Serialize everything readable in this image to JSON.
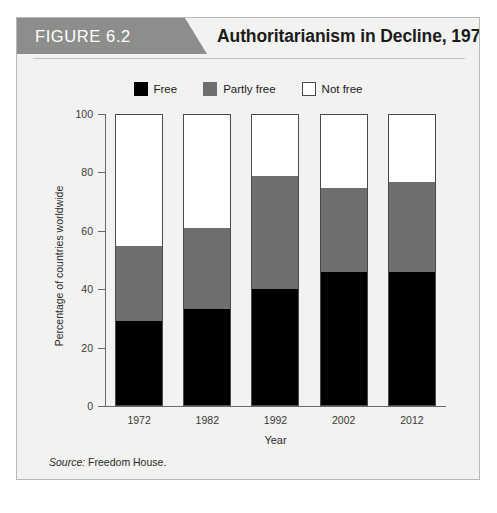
{
  "figure": {
    "tag": "FIGURE 6.2",
    "title": "Authoritarianism in Decline, 1972–2012",
    "source_label": "Source:",
    "source_text": "Freedom House."
  },
  "colors": {
    "free": "#000000",
    "partly_free": "#6e6e6c",
    "not_free": "#ffffff",
    "tag_band": "#8d8d8b",
    "card_background": "#f2f2f1",
    "card_border": "#b9b9b7",
    "axis": "#6a6a68"
  },
  "chart_data": {
    "type": "bar",
    "stacked": true,
    "title": "Authoritarianism in Decline, 1972–2012",
    "subtitle": "",
    "xlabel": "Year",
    "ylabel": "Percentage of countries worldwide",
    "categories": [
      "1972",
      "1982",
      "1992",
      "2002",
      "2012"
    ],
    "ylim": [
      0,
      100
    ],
    "yticks": [
      0,
      20,
      40,
      60,
      80,
      100
    ],
    "ytick_labels": [
      "0",
      "20",
      "40",
      "60",
      "80",
      "100"
    ],
    "grid": false,
    "legend_position": "top-center",
    "series": [
      {
        "name": "Free",
        "color": "#000000",
        "values": [
          29,
          33,
          40,
          46,
          46
        ]
      },
      {
        "name": "Partly free",
        "color": "#6e6e6c",
        "values": [
          26,
          28,
          39,
          29,
          31
        ]
      },
      {
        "name": "Not free",
        "color": "#ffffff",
        "values": [
          45,
          39,
          21,
          25,
          23
        ]
      }
    ],
    "annotations": []
  }
}
